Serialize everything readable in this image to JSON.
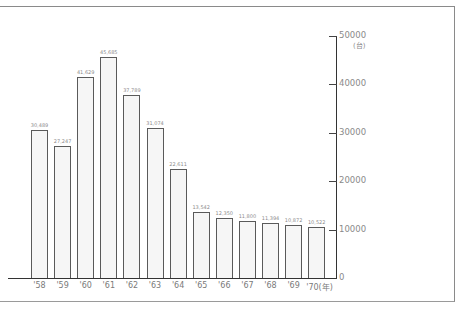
{
  "chart_data": {
    "type": "bar",
    "title": "",
    "xlabel": "(年)",
    "ylabel": "(台)",
    "categories": [
      "'58",
      "'59",
      "'60",
      "'61",
      "'62",
      "'63",
      "'64",
      "'65",
      "'66",
      "'67",
      "'68",
      "'69",
      "'70"
    ],
    "values": [
      30489,
      27247,
      41629,
      45685,
      37789,
      31074,
      22611,
      13542,
      12350,
      11800,
      11394,
      10872,
      10522
    ],
    "value_labels": [
      "30,489",
      "27,247",
      "41,629",
      "45,685",
      "37,789",
      "31,074",
      "22,611",
      "13,542",
      "12,350",
      "11,800",
      "11,394",
      "10,872",
      "10,522"
    ],
    "ylim": [
      0,
      50000
    ],
    "yticks": [
      0,
      10000,
      20000,
      30000,
      40000,
      50000
    ],
    "ytick_labels": [
      "0",
      "10000",
      "20000",
      "30000",
      "40000",
      "50000"
    ],
    "y_axis_position": "right",
    "grid": false,
    "legend": null
  },
  "axis": {
    "y_unit": "(台)",
    "x_unit": "(年)"
  }
}
